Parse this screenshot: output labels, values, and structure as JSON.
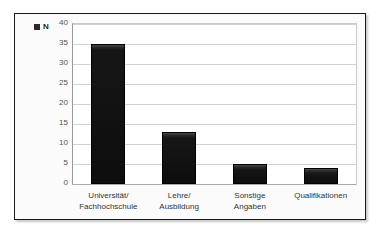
{
  "chart_data": {
    "type": "bar",
    "title": "",
    "xlabel": "",
    "ylabel": "",
    "ylim": [
      0,
      40
    ],
    "ytick_step": 5,
    "yticks": [
      "40",
      "35",
      "30",
      "25",
      "20",
      "15",
      "10",
      "5",
      "0"
    ],
    "grid": true,
    "legend_position": "top-left",
    "legend": [
      {
        "label": "N",
        "color": "#161616",
        "marker": "square"
      }
    ],
    "categories": [
      "Universität/ Fachhochschule",
      "Lehre/ Ausbildung",
      "Sonstige Angaben",
      "Qualifikationen"
    ],
    "category_lines": [
      [
        "Universität/",
        "Fachhochschule"
      ],
      [
        "Lehre/",
        "Ausbildung"
      ],
      [
        "Sonstige",
        "Angaben"
      ],
      [
        "Qualifikationen"
      ]
    ],
    "series": [
      {
        "name": "N",
        "color": "#161616",
        "values": [
          35,
          13,
          5,
          4
        ]
      }
    ]
  },
  "legend": {
    "swatch_name": "legend-swatch-n",
    "label": "N"
  },
  "colors": {
    "bar": "#161616",
    "frame": "#1a1a1a",
    "gridline": "#d2d2d2",
    "axis": "#9a9a9a",
    "tick_text": "#555555",
    "label_text": "#333333",
    "background": "#ffffff"
  }
}
